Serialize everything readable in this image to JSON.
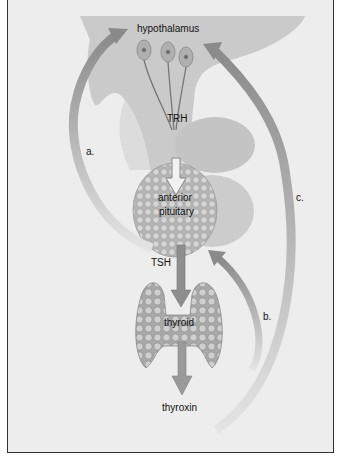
{
  "diagram": {
    "nodes": {
      "hypothalamus": "hypothalamus",
      "trh": "TRH",
      "anterior_pituitary_line1": "anterior",
      "anterior_pituitary_line2": "pituitary",
      "tsh": "TSH",
      "thyroid": "thyroid",
      "thyroxin": "thyroxin"
    },
    "feedback_labels": {
      "a": "a.",
      "b": "b.",
      "c": "c."
    },
    "edges": [
      {
        "from": "hypothalamus",
        "to": "anterior pituitary",
        "label": "TRH"
      },
      {
        "from": "anterior pituitary",
        "to": "thyroid",
        "label": "TSH"
      },
      {
        "from": "thyroid",
        "to": "thyroxin",
        "label": ""
      },
      {
        "from": "anterior pituitary",
        "to": "hypothalamus",
        "label": "a."
      },
      {
        "from": "thyroxin",
        "to": "anterior pituitary",
        "label": "b."
      },
      {
        "from": "thyroxin",
        "to": "hypothalamus",
        "label": "c."
      }
    ],
    "colors": {
      "background": "#ededed",
      "brain_tissue": "#c9c9c9",
      "gland": "#b8b8b8",
      "arrow": "#8a8a8a",
      "border": "#333333"
    }
  }
}
